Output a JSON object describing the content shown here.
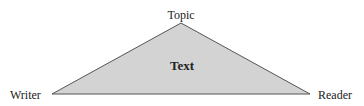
{
  "diagram": {
    "type": "rhetorical-triangle",
    "labels": {
      "top": "Topic",
      "center": "Text",
      "left": "Writer",
      "right": "Reader"
    },
    "colors": {
      "fill": "#d3d3d3",
      "stroke": "#555555",
      "text": "#222222"
    }
  }
}
